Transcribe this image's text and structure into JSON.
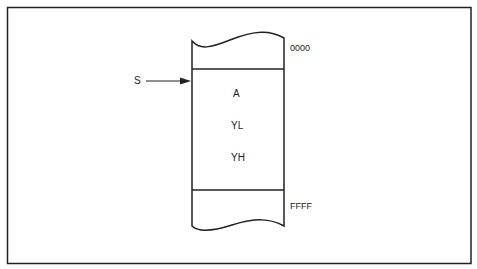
{
  "diagram": {
    "type": "stack-memory-map",
    "pointer_label": "S",
    "top_address": "0000",
    "bottom_address": "FFFF",
    "stack_entries": [
      "A",
      "YL",
      "YH"
    ]
  }
}
